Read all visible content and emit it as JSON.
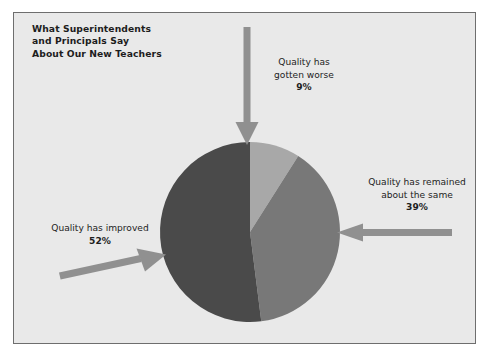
{
  "page": {
    "background_color": "#ffffff",
    "panel_background": "#e9e9e9",
    "panel_border_color": "#6e6e6e"
  },
  "title": {
    "line1": "What Superintendents",
    "line2": "and Principals Say",
    "line3": "About Our New Teachers"
  },
  "callouts": {
    "worse": {
      "line1": "Quality has",
      "line2": "gotten worse",
      "percent": "9%"
    },
    "same": {
      "line1": "Quality has remained",
      "line2": "about the same",
      "percent": "39%"
    },
    "improved": {
      "line1": "Quality has improved",
      "line2": "",
      "percent": "52%"
    }
  },
  "chart_data": {
    "type": "pie",
    "title": "What Superintendents and Principals Say About Our New Teachers",
    "categories": [
      "Quality has gotten worse",
      "Quality has remained about the same",
      "Quality has improved"
    ],
    "values": [
      9,
      39,
      52
    ],
    "value_labels": [
      "9%",
      "39%",
      "52%"
    ],
    "unit": "percent",
    "total": 100,
    "colors": [
      "#a8a8a8",
      "#787878",
      "#4a4a4a"
    ],
    "legend": "callout-labels-with-arrows",
    "start_angle_deg": 0,
    "direction": "clockwise",
    "center": [
      250,
      232
    ],
    "radius": 90,
    "grid": false,
    "xlabel": "",
    "ylabel": ""
  },
  "arrows": {
    "color": "#909090",
    "worse_arrow": "down-arrow",
    "same_arrow": "left-arrow",
    "improved_arrow": "right-arrow"
  }
}
